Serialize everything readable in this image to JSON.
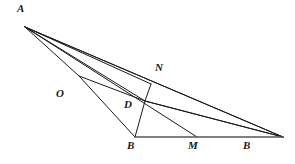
{
  "figure": {
    "type": "geometry-diagram",
    "width": 295,
    "height": 164,
    "background_color": "#ffffff",
    "stroke_color": "#1a1a1a",
    "base_stroke_color": "#555555",
    "stroke_width": 1.0,
    "label_font_size": 11
  },
  "points": {
    "A": {
      "label": "A",
      "x": 25,
      "y": 27,
      "label_x": 17,
      "label_y": 3
    },
    "O": {
      "label": "O",
      "x": 79,
      "y": 76,
      "label_x": 56,
      "label_y": 88
    },
    "N": {
      "label": "N",
      "x": 151,
      "y": 84,
      "label_x": 155,
      "label_y": 62
    },
    "D": {
      "label": "D",
      "x": 145,
      "y": 101,
      "label_x": 124,
      "label_y": 99
    },
    "B1": {
      "label": "B",
      "x": 135,
      "y": 137,
      "label_x": 127,
      "label_y": 140
    },
    "M": {
      "label": "M",
      "x": 197,
      "y": 137,
      "label_x": 188,
      "label_y": 140
    },
    "B2": {
      "label": "B",
      "x": 283,
      "y": 137,
      "label_x": 243,
      "label_y": 140
    }
  },
  "segments": [
    {
      "name": "A-N-B2-upper",
      "from": "A",
      "to": "B2",
      "via": "N"
    },
    {
      "name": "A-D-B2",
      "from": "A",
      "to": "B2",
      "via": "D"
    },
    {
      "name": "A-M",
      "from": "A",
      "to": "M"
    },
    {
      "name": "A-O-B1",
      "from": "A",
      "to": "B1",
      "via": "O"
    },
    {
      "name": "O-D-B2",
      "from": "O",
      "to": "B2",
      "via": "D"
    },
    {
      "name": "N-D-B1",
      "from": "N",
      "to": "B1",
      "via": "D"
    },
    {
      "name": "base-B1-B2",
      "from": "B1",
      "to": "B2"
    }
  ]
}
